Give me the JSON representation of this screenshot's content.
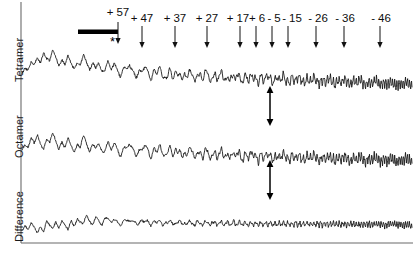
{
  "figure": {
    "title": "",
    "traces": [
      {
        "name": "Tetramer",
        "label": "Tetramer"
      },
      {
        "name": "Octamer",
        "label": "Octamer"
      },
      {
        "name": "Difference",
        "label": "Difference"
      }
    ],
    "annotations": {
      "asterisk": "*",
      "bar_name": "solid-horizontal-bar"
    }
  },
  "chart_data": {
    "type": "line",
    "title": "",
    "xlabel": "",
    "ylabel": "",
    "grid": false,
    "legend": "none",
    "axis": {
      "x_range": [
        0,
        414
      ],
      "y_range": [
        0,
        254
      ],
      "ticks": "none"
    },
    "charge_state_labels": [
      "+ 57",
      "+ 47",
      "+ 37",
      "+ 27",
      "+ 17",
      "+ 6",
      "- 5",
      "- 15",
      "- 26",
      "- 36",
      "- 46"
    ],
    "charge_state_values": [
      57,
      47,
      37,
      27,
      17,
      6,
      -5,
      -15,
      -26,
      -36,
      -46
    ],
    "charge_state_x": [
      118,
      142,
      175,
      207,
      240,
      256,
      272,
      288,
      316,
      344,
      380
    ],
    "charge_label_x": [
      118,
      142,
      175,
      207,
      238,
      257,
      274,
      292,
      318,
      345,
      381
    ],
    "series": [
      {
        "name": "Tetramer",
        "baseline_y": 88,
        "values": [
          0.22,
          0.3,
          0.26,
          0.36,
          0.31,
          0.42,
          0.36,
          0.5,
          0.4,
          0.34,
          0.46,
          0.38,
          0.3,
          0.41,
          0.33,
          0.44,
          0.34,
          0.28,
          0.38,
          0.3,
          0.4,
          0.31,
          0.25,
          0.35,
          0.27,
          0.36,
          0.28,
          0.22,
          0.32,
          0.24,
          0.33,
          0.25,
          0.19,
          0.29,
          0.21,
          0.3,
          0.22,
          0.17,
          0.26,
          0.19,
          0.28,
          0.2,
          0.15,
          0.24,
          0.17,
          0.26,
          0.18,
          0.13,
          0.22,
          0.15,
          0.24,
          0.16,
          0.12,
          0.21,
          0.14,
          0.23,
          0.15,
          0.11,
          0.2,
          0.13,
          0.22,
          0.14,
          0.1,
          0.19,
          0.12,
          0.21,
          0.13,
          0.09,
          0.18,
          0.11,
          0.2,
          0.12,
          0.09,
          0.17,
          0.1,
          0.19,
          0.11,
          0.08,
          0.16,
          0.1,
          0.18,
          0.11,
          0.08,
          0.15,
          0.09,
          0.17,
          0.1,
          0.07,
          0.14,
          0.09,
          0.16,
          0.1,
          0.07,
          0.13,
          0.08,
          0.15,
          0.09,
          0.06,
          0.12,
          0.07,
          0.14,
          0.08,
          0.05,
          0.11,
          0.07,
          0.13,
          0.08,
          0.05,
          0.1,
          0.06,
          0.12,
          0.07,
          0.04,
          0.09,
          0.05,
          0.11,
          0.06,
          0.04,
          0.08,
          0.05,
          0.1,
          0.05,
          0.03,
          0.07,
          0.04,
          0.09,
          0.05,
          0.03
        ]
      },
      {
        "name": "Octamer",
        "baseline_y": 170,
        "values": [
          0.3,
          0.38,
          0.32,
          0.44,
          0.36,
          0.48,
          0.38,
          0.3,
          0.42,
          0.34,
          0.46,
          0.36,
          0.28,
          0.4,
          0.32,
          0.44,
          0.34,
          0.27,
          0.38,
          0.3,
          0.42,
          0.32,
          0.25,
          0.36,
          0.28,
          0.39,
          0.3,
          0.24,
          0.34,
          0.26,
          0.37,
          0.28,
          0.22,
          0.32,
          0.25,
          0.35,
          0.27,
          0.21,
          0.3,
          0.23,
          0.33,
          0.25,
          0.2,
          0.29,
          0.22,
          0.31,
          0.24,
          0.19,
          0.28,
          0.21,
          0.3,
          0.23,
          0.18,
          0.26,
          0.2,
          0.29,
          0.22,
          0.17,
          0.25,
          0.19,
          0.27,
          0.21,
          0.16,
          0.24,
          0.18,
          0.26,
          0.2,
          0.16,
          0.23,
          0.18,
          0.25,
          0.19,
          0.15,
          0.22,
          0.17,
          0.24,
          0.18,
          0.14,
          0.21,
          0.16,
          0.23,
          0.18,
          0.14,
          0.2,
          0.16,
          0.22,
          0.17,
          0.13,
          0.2,
          0.15,
          0.21,
          0.16,
          0.13,
          0.19,
          0.15,
          0.21,
          0.16,
          0.12,
          0.18,
          0.14,
          0.2,
          0.15,
          0.12,
          0.18,
          0.14,
          0.19,
          0.15,
          0.11,
          0.17,
          0.13,
          0.19,
          0.14,
          0.11,
          0.16,
          0.13,
          0.18,
          0.14,
          0.1,
          0.16,
          0.12,
          0.17,
          0.13,
          0.1,
          0.15,
          0.12,
          0.17,
          0.13,
          0.1
        ]
      },
      {
        "name": "Difference",
        "baseline_y": 240,
        "values": [
          0.2,
          0.3,
          0.22,
          0.34,
          0.24,
          0.14,
          0.28,
          0.18,
          0.36,
          0.26,
          0.16,
          0.32,
          0.22,
          0.4,
          0.3,
          0.2,
          0.38,
          0.28,
          0.44,
          0.34,
          0.26,
          0.46,
          0.36,
          0.3,
          0.44,
          0.38,
          0.32,
          0.42,
          0.36,
          0.33,
          0.4,
          0.35,
          0.32,
          0.38,
          0.34,
          0.37,
          0.33,
          0.36,
          0.33,
          0.36,
          0.33,
          0.35,
          0.32,
          0.35,
          0.33,
          0.35,
          0.32,
          0.34,
          0.32,
          0.34,
          0.32,
          0.34,
          0.32,
          0.34,
          0.32,
          0.33,
          0.31,
          0.33,
          0.31,
          0.33,
          0.32,
          0.33,
          0.31,
          0.33,
          0.31,
          0.33,
          0.31,
          0.32,
          0.31,
          0.33,
          0.31,
          0.32,
          0.31,
          0.32,
          0.3,
          0.32,
          0.31,
          0.32,
          0.3,
          0.32,
          0.31,
          0.32,
          0.3,
          0.32,
          0.3,
          0.32,
          0.3,
          0.31,
          0.3,
          0.32,
          0.3,
          0.31,
          0.3,
          0.31,
          0.3,
          0.31,
          0.3,
          0.31,
          0.3,
          0.31,
          0.3,
          0.31,
          0.3,
          0.31,
          0.3,
          0.31,
          0.3,
          0.31,
          0.3,
          0.31,
          0.3,
          0.31,
          0.3,
          0.31,
          0.3,
          0.31,
          0.3,
          0.31,
          0.29,
          0.31,
          0.3,
          0.31,
          0.29,
          0.31,
          0.29,
          0.3,
          0.28,
          0.27
        ]
      }
    ],
    "double_arrows": [
      {
        "name": "tetramer-octamer-spacing",
        "x": 270,
        "y_top": 86,
        "y_bottom": 126
      },
      {
        "name": "octamer-difference-spacing",
        "x": 270,
        "y_top": 160,
        "y_bottom": 200
      }
    ]
  }
}
